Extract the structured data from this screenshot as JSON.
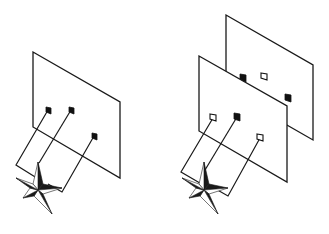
{
  "figure": {
    "left_diagram": {
      "panels": [
        {
          "name": "single-screen",
          "corners": [
            [
              33,
              52
            ],
            [
              120,
              102
            ],
            [
              120,
              178
            ],
            [
              33,
              127
            ]
          ]
        }
      ],
      "apertures": [
        {
          "x": 48,
          "y": 110,
          "style": "filled"
        },
        {
          "x": 71,
          "y": 110,
          "style": "filled"
        },
        {
          "x": 94,
          "y": 136,
          "style": "filled"
        }
      ],
      "source": {
        "shape": "four-point-star",
        "cx": 38,
        "cy": 190
      }
    },
    "right_diagram": {
      "panels": [
        {
          "name": "back-screen",
          "corners": [
            [
              226,
              15
            ],
            [
              313,
              65
            ],
            [
              313,
              140
            ],
            [
              226,
              90
            ]
          ]
        },
        {
          "name": "front-screen",
          "corners": [
            [
              199,
              56
            ],
            [
              287,
              106
            ],
            [
              287,
              182
            ],
            [
              199,
              131
            ]
          ]
        }
      ],
      "back_apertures": [
        {
          "x": 243,
          "y": 78,
          "style": "filled"
        },
        {
          "x": 264,
          "y": 77,
          "style": "hollow"
        },
        {
          "x": 288,
          "y": 98,
          "style": "filled"
        }
      ],
      "front_apertures": [
        {
          "x": 213,
          "y": 118,
          "style": "hollow"
        },
        {
          "x": 237,
          "y": 117,
          "style": "filled"
        },
        {
          "x": 260,
          "y": 138,
          "style": "hollow"
        }
      ],
      "source": {
        "shape": "four-point-star",
        "cx": 204,
        "cy": 190
      }
    },
    "colors": {
      "line": "#1a1a1a",
      "background": "#ffffff"
    }
  }
}
